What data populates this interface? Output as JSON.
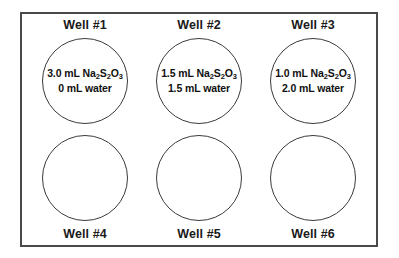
{
  "diagram": {
    "frame": {
      "border_color": "#4a4a4a",
      "background_color": "#ffffff"
    },
    "circle": {
      "border_color": "#3a3a3a"
    },
    "text_color": "#111111",
    "wells": [
      {
        "label": "Well #1",
        "label_position": "top",
        "filled": true,
        "line1_prefix": "3.0 mL Na",
        "line1_sub1": "2",
        "line1_mid1": "S",
        "line1_sub2": "2",
        "line1_mid2": "O",
        "line1_sub3": "3",
        "line2": "0 mL water"
      },
      {
        "label": "Well #2",
        "label_position": "top",
        "filled": true,
        "line1_prefix": "1.5 mL Na",
        "line1_sub1": "2",
        "line1_mid1": "S",
        "line1_sub2": "2",
        "line1_mid2": "O",
        "line1_sub3": "3",
        "line2": "1.5 mL water"
      },
      {
        "label": "Well #3",
        "label_position": "top",
        "filled": true,
        "line1_prefix": "1.0 mL Na",
        "line1_sub1": "2",
        "line1_mid1": "S",
        "line1_sub2": "2",
        "line1_mid2": "O",
        "line1_sub3": "3",
        "line2": "2.0 mL water"
      },
      {
        "label": "Well #4",
        "label_position": "bottom",
        "filled": false,
        "line1_prefix": "",
        "line1_sub1": "",
        "line1_mid1": "",
        "line1_sub2": "",
        "line1_mid2": "",
        "line1_sub3": "",
        "line2": ""
      },
      {
        "label": "Well #5",
        "label_position": "bottom",
        "filled": false,
        "line1_prefix": "",
        "line1_sub1": "",
        "line1_mid1": "",
        "line1_sub2": "",
        "line1_mid2": "",
        "line1_sub3": "",
        "line2": ""
      },
      {
        "label": "Well #6",
        "label_position": "bottom",
        "filled": false,
        "line1_prefix": "",
        "line1_sub1": "",
        "line1_mid1": "",
        "line1_sub2": "",
        "line1_mid2": "",
        "line1_sub3": "",
        "line2": ""
      }
    ]
  }
}
